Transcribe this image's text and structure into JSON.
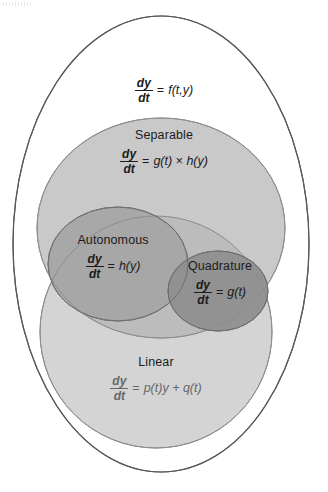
{
  "diagram": {
    "type": "venn-diagram",
    "background_color": "#ffffff",
    "outline_color": "#565656",
    "regions": [
      {
        "id": "toplevel",
        "name": "dy/dt = f(t,y)",
        "shape": "ellipse",
        "fill": "#ffffff",
        "label": "",
        "equation": {
          "numerator": "dy",
          "denominator": "dt",
          "relation": "=",
          "rhs": "f(t,y)"
        }
      },
      {
        "id": "separable",
        "name": "Separable",
        "shape": "ellipse",
        "fill": "#c2c2c2",
        "label": "Separable",
        "equation": {
          "numerator": "dy",
          "denominator": "dt",
          "relation": "=",
          "rhs": "g(t) × h(y)"
        }
      },
      {
        "id": "autonomous",
        "name": "Autonomous",
        "shape": "circle",
        "fill": "#a6a6a6",
        "label": "Autonomous",
        "equation": {
          "numerator": "dy",
          "denominator": "dt",
          "relation": "=",
          "rhs": "h(y)"
        }
      },
      {
        "id": "quadrature",
        "name": "Quadrature",
        "shape": "circle",
        "fill": "#909090",
        "label": "Quadrature",
        "equation": {
          "numerator": "dy",
          "denominator": "dt",
          "relation": "=",
          "rhs": "g(t)"
        }
      },
      {
        "id": "linear",
        "name": "Linear",
        "shape": "ellipse",
        "fill": "#d2d2d2",
        "label": "Linear",
        "equation": {
          "numerator": "dy",
          "denominator": "dt",
          "relation": "=",
          "rhs": "p(t)y + q(t)"
        }
      }
    ]
  }
}
